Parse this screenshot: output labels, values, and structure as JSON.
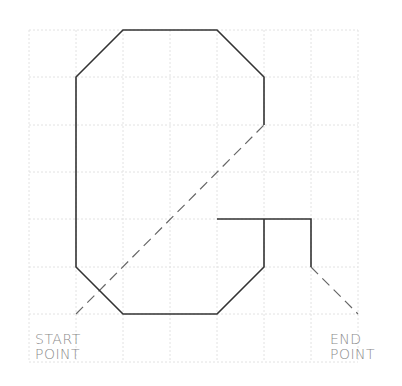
{
  "diagram": {
    "grid": {
      "x_lines": [
        29,
        76,
        123,
        170,
        217,
        264,
        311,
        358
      ],
      "y_lines": [
        30,
        77,
        125,
        172,
        219,
        267,
        314,
        362
      ],
      "color": "#e4e4e4"
    },
    "stroke_color": "#333333",
    "dash_color": "#555555",
    "labels": {
      "start_line1": "START",
      "start_line2": "POINT",
      "end_line1": "END",
      "end_line2": "POINT"
    }
  }
}
